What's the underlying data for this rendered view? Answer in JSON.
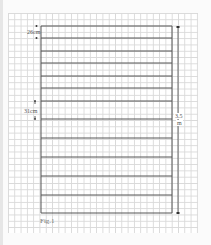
{
  "diagram": {
    "type": "ladder-panel",
    "caption": "Fig.1",
    "top_spacing_label": "26cm",
    "lower_spacing_label": "31cm",
    "height_label_line1": "3.5",
    "height_label_line2": "m",
    "rungs_count": 13,
    "rung_y": [
      26,
      38,
      51,
      63,
      76,
      88,
      101,
      119,
      138,
      157,
      176,
      195,
      213
    ],
    "frame": {
      "left": 41,
      "right": 172,
      "top": 26,
      "bottom": 213
    },
    "line_color": "#555555",
    "grid_color": "#d9d9d9"
  }
}
